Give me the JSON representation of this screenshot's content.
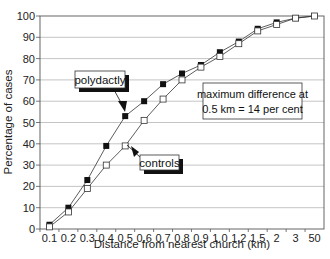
{
  "chart_data": {
    "type": "line",
    "title": "",
    "xlabel": "Distance from nearest church (km)",
    "ylabel": "Percentage of cases",
    "ylim": [
      0,
      100
    ],
    "yticks": [
      0,
      10,
      20,
      30,
      40,
      50,
      60,
      70,
      80,
      90,
      100
    ],
    "grid": true,
    "categories": [
      "0.1",
      "0.2",
      "0.3",
      "0.4",
      "0.5",
      "0.6",
      "0.7",
      "0.8",
      "0.9",
      "1.0",
      "1.2",
      "1.5",
      "2",
      "3",
      "50"
    ],
    "series": [
      {
        "name": "polydactly",
        "marker": "filled-square",
        "values": [
          2,
          10,
          23,
          39,
          53,
          60,
          68,
          73,
          77,
          83,
          88,
          94,
          97,
          99,
          100
        ]
      },
      {
        "name": "controls",
        "marker": "open-square",
        "values": [
          1,
          8,
          19,
          30,
          39,
          51,
          61,
          70,
          76,
          81,
          87,
          93,
          96,
          99,
          100
        ]
      }
    ],
    "annotations": [
      {
        "text_line1": "maximum difference at",
        "text_line2": "0.5 km = 14 per cent"
      }
    ],
    "legend_position": "inline callout labels"
  },
  "labels": {
    "polydactly": "polydactly",
    "controls": "controls",
    "annotation_line1": "maximum difference at",
    "annotation_line2": "0.5 km = 14 per cent",
    "xlabel": "Distance from nearest church (km)",
    "ylabel": "Percentage of cases"
  }
}
